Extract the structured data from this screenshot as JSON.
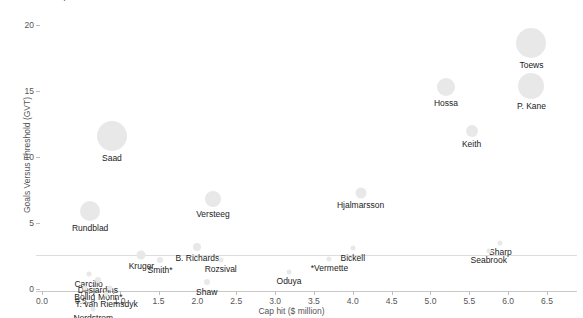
{
  "chart": {
    "title": "Blackhawks: cap hit versus GVT",
    "xlabel": "Cap hit ($ million)",
    "ylabel": "Goals Versus Threshold (GVT)",
    "xticks": [
      "0.0",
      "0.5",
      "1.0",
      "1.5",
      "2.0",
      "2.5",
      "3.0",
      "3.5",
      "4.0",
      "4.5",
      "5.0",
      "5.5",
      "6.0",
      "6.5"
    ],
    "yticks": [
      "0",
      "5",
      "10",
      "15",
      "20"
    ]
  },
  "chart_data": {
    "type": "scatter",
    "title": "Blackhawks: cap hit versus GVT",
    "xlabel": "Cap hit ($ million)",
    "ylabel": "Goals Versus Threshold (GVT)",
    "xlim": [
      0.0,
      6.5
    ],
    "ylim": [
      0,
      20
    ],
    "grid": false,
    "legend": "none",
    "size_encodes": "bubble area scales with player ice time",
    "points": [
      {
        "label": "Toews",
        "x": 6.3,
        "y": 18.6,
        "size": 30
      },
      {
        "label": "P. Kane",
        "x": 6.3,
        "y": 15.4,
        "size": 26
      },
      {
        "label": "Hossa",
        "x": 5.2,
        "y": 15.3,
        "size": 18
      },
      {
        "label": "Keith",
        "x": 5.53,
        "y": 12.0,
        "size": 12
      },
      {
        "label": "Saad",
        "x": 0.9,
        "y": 11.6,
        "size": 30
      },
      {
        "label": "Hjalmarsson",
        "x": 4.1,
        "y": 7.3,
        "size": 11
      },
      {
        "label": "Versteeg",
        "x": 2.2,
        "y": 6.8,
        "size": 16
      },
      {
        "label": "Rundblad",
        "x": 0.62,
        "y": 5.9,
        "size": 20
      },
      {
        "label": "Sharp",
        "x": 5.9,
        "y": 3.5,
        "size": 5
      },
      {
        "label": "Seabrook",
        "x": 5.75,
        "y": 2.9,
        "size": 5
      },
      {
        "label": "Bickell",
        "x": 4.0,
        "y": 3.1,
        "size": 5
      },
      {
        "label": "B. Richards",
        "x": 2.0,
        "y": 3.2,
        "size": 8
      },
      {
        "label": "Rozsival",
        "x": 2.3,
        "y": 2.2,
        "size": 5
      },
      {
        "label": "*Vermette",
        "x": 3.7,
        "y": 2.3,
        "size": 5
      },
      {
        "label": "Kruger",
        "x": 1.28,
        "y": 2.6,
        "size": 9
      },
      {
        "label": "Smith*",
        "x": 1.52,
        "y": 2.2,
        "size": 6
      },
      {
        "label": "Oduya",
        "x": 3.18,
        "y": 1.3,
        "size": 5
      },
      {
        "label": "Shaw",
        "x": 2.12,
        "y": 0.5,
        "size": 6
      },
      {
        "label": "Carcillo",
        "x": 0.6,
        "y": 1.1,
        "size": 5
      },
      {
        "label": "Desjardins",
        "x": 0.72,
        "y": 0.7,
        "size": 6
      },
      {
        "label": "Morin*",
        "x": 0.88,
        "y": 0.1,
        "size": 5
      },
      {
        "label": "T. van Riemsdyk",
        "x": 0.83,
        "y": -0.4,
        "size": 5
      },
      {
        "label": "Bollig",
        "x": 0.55,
        "y": 0.1,
        "size": 5
      },
      {
        "label": "Nordstrom",
        "x": 0.66,
        "y": -1.5,
        "size": 5
      }
    ]
  },
  "labels": {
    "toews": "Toews",
    "pkane": "P. Kane",
    "hossa": "Hossa",
    "keith": "Keith",
    "saad": "Saad",
    "hjalmarsson": "Hjalmarsson",
    "versteeg": "Versteeg",
    "rundblad": "Rundblad",
    "sharp": "Sharp",
    "seabrook": "Seabrook",
    "bickell": "Bickell",
    "brichards": "B. Richards",
    "rozsival": "Rozsival",
    "vermette": "*Vermette",
    "kruger": "Kruger",
    "smith": "Smith*",
    "oduya": "Oduya",
    "shaw": "Shaw",
    "carcillo": "Carcillo",
    "desjardins": "Desjardins",
    "morin": "Morin*",
    "tvanriemsdyk": "T. van Riemsdyk",
    "bollig": "Bollig",
    "nordstrom": "Nordstrom"
  }
}
